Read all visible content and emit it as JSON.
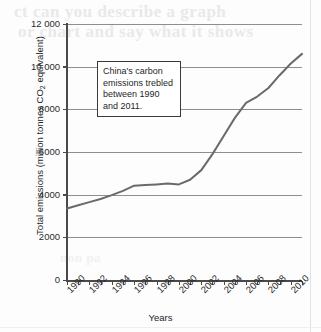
{
  "chart_data": {
    "type": "line",
    "title": "",
    "xlabel": "Years",
    "ylabel": "Total emissions (million tonnes CO2 equivalent)",
    "ylabel_prefix": "Total emissions (million tonnes CO",
    "ylabel_subscript": "2",
    "ylabel_suffix": " equivalent)",
    "grid": true,
    "legend": "none",
    "xlim": [
      1990,
      2011
    ],
    "ylim": [
      0,
      12000
    ],
    "ytick_values": [
      12000,
      10000,
      8000,
      6000,
      4000,
      2000,
      0
    ],
    "ytick_labels": [
      "12 000",
      "10 000",
      "8000",
      "6000",
      "4000",
      "2000",
      "0"
    ],
    "xtick_values": [
      1990,
      1992,
      1994,
      1996,
      1998,
      2000,
      2002,
      2004,
      2006,
      2008,
      2010
    ],
    "xtick_labels": [
      "1990",
      "1992",
      "1994",
      "1996",
      "1998",
      "2000",
      "2002",
      "2004",
      "2006",
      "2008",
      "2010"
    ],
    "x_minor_ticks": [
      1991,
      1993,
      1995,
      1997,
      1999,
      2001,
      2003,
      2005,
      2007,
      2009,
      2011
    ],
    "series": [
      {
        "name": "China carbon emissions",
        "color": "#6a6a6a",
        "x": [
          1990,
          1991,
          1992,
          1993,
          1994,
          1995,
          1996,
          1997,
          1998,
          1999,
          2000,
          2001,
          2002,
          2003,
          2004,
          2005,
          2006,
          2007,
          2008,
          2009,
          2010,
          2011
        ],
        "values": [
          3350,
          3500,
          3650,
          3800,
          3980,
          4180,
          4420,
          4450,
          4480,
          4520,
          4480,
          4700,
          5150,
          5900,
          6750,
          7600,
          8300,
          8600,
          9000,
          9600,
          10150,
          10600
        ]
      }
    ],
    "annotations": [
      {
        "id": "trebled-note",
        "text": "China's carbon emissions trebled between 1990 and 2011.",
        "lines": [
          "China's carbon",
          "emissions trebled",
          "between 1990",
          "and 2011."
        ]
      }
    ]
  },
  "bleed_through": {
    "line1": "ct can you describe a graph",
    "line2": "or chart and say what it shows",
    "line3": "non pa"
  },
  "colors": {
    "line": "#6a6a6a",
    "grid": "#8e8e8e",
    "axis": "#4a4a4a",
    "text": "#1f1f1f",
    "annotation_border": "#3a3a3a",
    "annotation_fill": "#ffffff"
  }
}
